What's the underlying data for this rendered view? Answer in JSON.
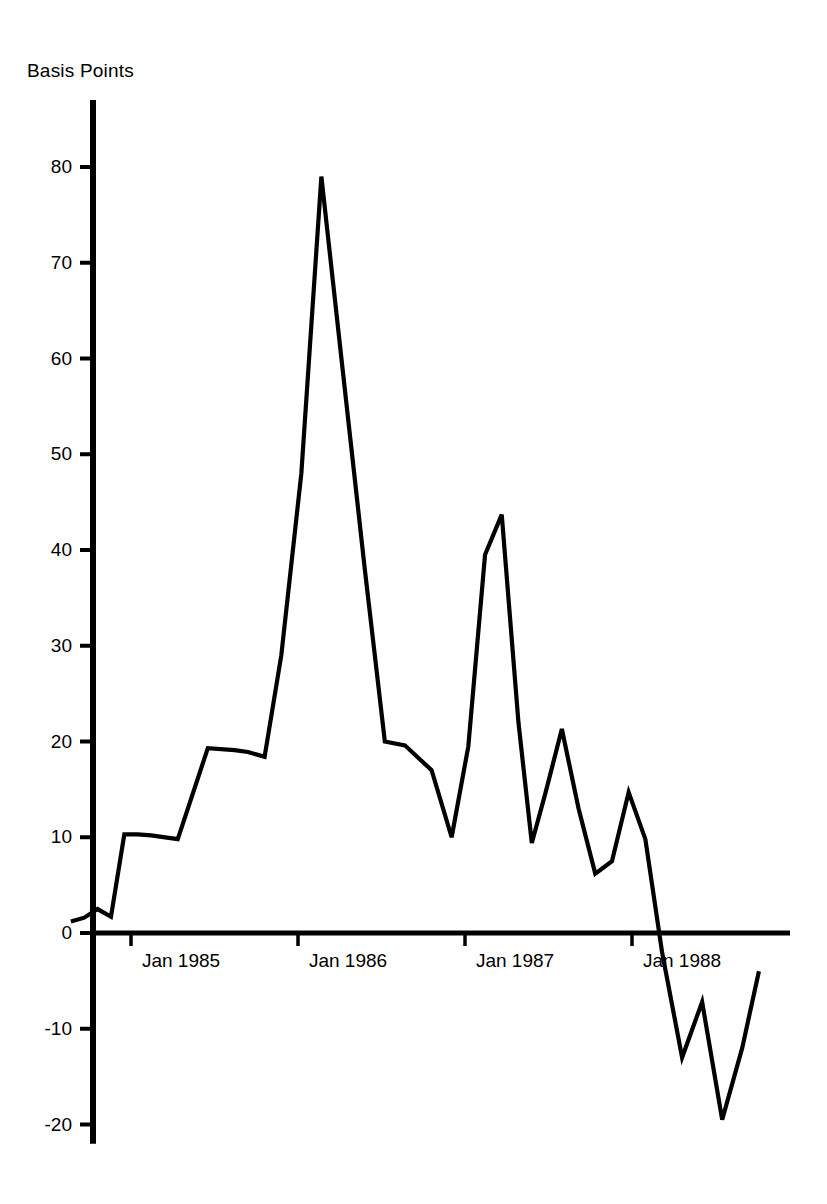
{
  "chart_data": {
    "type": "line",
    "title": "",
    "subtitle": "",
    "ylabel": "Basis Points",
    "xlabel": "",
    "grid": false,
    "legend": null,
    "line_color": "#000000",
    "background_color": "#ffffff",
    "ylim": [
      -22,
      87
    ],
    "yticks": [
      80,
      70,
      60,
      50,
      40,
      30,
      20,
      10,
      0,
      -10,
      -20
    ],
    "ytick_labels": [
      "80",
      "70",
      "60",
      "50",
      "40",
      "30",
      "20",
      "10",
      "0",
      "-10",
      "-20"
    ],
    "xlim": [
      1984.62,
      1988.85
    ],
    "xticks": [
      1985.0,
      1986.0,
      1987.0,
      1988.0
    ],
    "xtick_labels": [
      "Jan 1985",
      "Jan 1986",
      "Jan 1987",
      "Jan 1988"
    ],
    "zero_line": 0,
    "x": [
      1984.64,
      1984.72,
      1984.8,
      1984.88,
      1984.96,
      1985.04,
      1985.12,
      1985.28,
      1985.46,
      1985.62,
      1985.7,
      1985.8,
      1985.9,
      1986.02,
      1986.14,
      1986.26,
      1986.4,
      1986.52,
      1986.64,
      1986.8,
      1986.92,
      1987.02,
      1987.12,
      1987.22,
      1987.32,
      1987.4,
      1987.48,
      1987.58,
      1987.68,
      1987.78,
      1987.88,
      1987.98,
      1988.08,
      1988.18,
      1988.3,
      1988.42,
      1988.54,
      1988.66,
      1988.76
    ],
    "values": [
      1.2,
      1.6,
      2.5,
      1.7,
      10.3,
      10.3,
      10.2,
      9.8,
      19.3,
      19.1,
      18.9,
      18.4,
      29.0,
      48.0,
      79.0,
      60.0,
      38.0,
      20.0,
      19.6,
      17.0,
      10.0,
      19.5,
      39.5,
      43.7,
      22.0,
      9.4,
      14.5,
      21.3,
      13.0,
      6.2,
      7.5,
      14.7,
      9.8,
      -2.0,
      -13.0,
      -7.2,
      -19.5,
      -12.0,
      -4.0
    ],
    "annotations": []
  },
  "axis_title": "Basis Points",
  "ytick_labels": [
    "80",
    "70",
    "60",
    "50",
    "40",
    "30",
    "20",
    "10",
    "0",
    "-10",
    "-20"
  ],
  "xtick_labels": [
    "Jan 1985",
    "Jan 1986",
    "Jan 1987",
    "Jan 1988"
  ]
}
